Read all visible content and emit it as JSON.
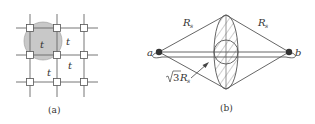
{
  "figure": {
    "panel_a": {
      "caption": "(a)",
      "cell_labels": [
        "t",
        "t",
        "t",
        "t"
      ],
      "shaded_fill": "#c8c8c8"
    },
    "panel_b": {
      "caption": "(b)",
      "node_a": "a",
      "node_b": "b",
      "edge_left_label": "R",
      "edge_left_sub": "s",
      "edge_right_label": "R",
      "edge_right_sub": "s",
      "pointer_label_prefix": "√3",
      "pointer_label_var": "R",
      "pointer_label_sub": "s"
    },
    "colors": {
      "line": "#555555",
      "node": "#333333"
    }
  }
}
